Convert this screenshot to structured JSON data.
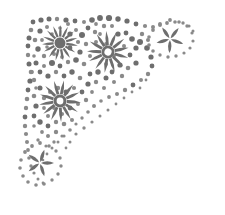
{
  "artwork": {
    "title": "Floral Corner Ornament",
    "kind": "decorative-corner-flourish",
    "orientation": "top-left-corner",
    "canvas": {
      "width": 225,
      "height": 215
    },
    "background_color": "#ffffff",
    "ink_color": "#6e6e6e",
    "ink_color_light": "#8a8a8a",
    "ink_color_dark": "#5f5f5f",
    "center_hole_color": "#ffffff",
    "style_notes": "halftone-stippled grayscale clipart, scanned line-art look",
    "element_counts": {
      "flowers": 3,
      "asterisk_sprigs": 2,
      "scatter_dots": 188
    }
  },
  "flowers": [
    {
      "name": "flower-top-left",
      "cx": 60,
      "cy": 43,
      "outer_radius": 18,
      "inner_radius": 6.5,
      "petals": 15,
      "rotation": 8,
      "has_open_center": false,
      "core_radius": 5.5,
      "color": "#6e6e6e"
    },
    {
      "name": "flower-top-right",
      "cx": 108,
      "cy": 52,
      "outer_radius": 21,
      "inner_radius": 7,
      "petals": 13,
      "rotation": 16,
      "has_open_center": true,
      "core_radius": 6.5,
      "hole_radius": 3.6,
      "color": "#6e6e6e"
    },
    {
      "name": "flower-lower-left",
      "cx": 60,
      "cy": 101,
      "outer_radius": 21,
      "inner_radius": 7,
      "petals": 13,
      "rotation": 4,
      "has_open_center": true,
      "core_radius": 6.5,
      "hole_radius": 3.4,
      "color": "#6e6e6e"
    }
  ],
  "sprigs": [
    {
      "name": "sprig-top-right",
      "cx": 170,
      "cy": 39,
      "arms": 5,
      "arm_length": 14,
      "arm_width": 3.4,
      "rotation": 20,
      "color": "#6e6e6e"
    },
    {
      "name": "sprig-bottom-left",
      "cx": 40,
      "cy": 163,
      "arms": 5,
      "arm_length": 14,
      "arm_width": 3.4,
      "rotation": 72,
      "color": "#6e6e6e"
    }
  ],
  "dot_paths": [
    {
      "name": "outline-arc-top",
      "description": "dotted arc sweeping along the upper edge from the left margin to the top-right sprig",
      "dots": [
        [
          33,
          22,
          2.4
        ],
        [
          41,
          20,
          2.6
        ],
        [
          49,
          19,
          2.5
        ],
        [
          57,
          19,
          2.2
        ],
        [
          66,
          20,
          2.6
        ],
        [
          75,
          21,
          2.4
        ],
        [
          84,
          22,
          2.0
        ],
        [
          92,
          20,
          2.8
        ],
        [
          100,
          18,
          2.9
        ],
        [
          109,
          18,
          3.1
        ],
        [
          118,
          19,
          2.7
        ],
        [
          127,
          21,
          2.6
        ],
        [
          136,
          24,
          2.4
        ],
        [
          145,
          26,
          2.1
        ],
        [
          153,
          27,
          2.0
        ],
        [
          160,
          25,
          1.9
        ],
        [
          167,
          23,
          1.9
        ],
        [
          175,
          22,
          1.8
        ],
        [
          183,
          23,
          1.7
        ],
        [
          189,
          26,
          1.6
        ],
        [
          193,
          31,
          1.5
        ]
      ]
    },
    {
      "name": "outline-arc-left",
      "description": "dotted arc running down the left edge toward the bottom sprig",
      "dots": [
        [
          31,
          30,
          2.3
        ],
        [
          29,
          38,
          2.5
        ],
        [
          28,
          46,
          2.4
        ],
        [
          28,
          55,
          2.2
        ],
        [
          29,
          64,
          2.5
        ],
        [
          31,
          72,
          2.3
        ],
        [
          30,
          81,
          2.6
        ],
        [
          28,
          90,
          2.4
        ],
        [
          27,
          99,
          2.3
        ],
        [
          26,
          108,
          2.2
        ],
        [
          25,
          117,
          2.4
        ],
        [
          25,
          126,
          2.2
        ],
        [
          26,
          134,
          2.1
        ],
        [
          27,
          142,
          2.0
        ],
        [
          28,
          150,
          1.9
        ],
        [
          29,
          158,
          1.8
        ],
        [
          31,
          166,
          1.7
        ],
        [
          34,
          173,
          1.6
        ],
        [
          38,
          179,
          1.5
        ],
        [
          43,
          183,
          1.4
        ]
      ]
    },
    {
      "name": "inner-diagonal-fade",
      "description": "dots thinning along the inner diagonal from top-right to bottom-left",
      "dots": [
        [
          140,
          42,
          3.0
        ],
        [
          147,
          48,
          2.8
        ],
        [
          151,
          57,
          2.6
        ],
        [
          152,
          66,
          2.4
        ],
        [
          148,
          74,
          2.2
        ],
        [
          141,
          80,
          2.0
        ],
        [
          133,
          85,
          2.4
        ],
        [
          125,
          90,
          2.2
        ],
        [
          117,
          94,
          2.0
        ],
        [
          109,
          97,
          1.9
        ],
        [
          101,
          101,
          1.8
        ],
        [
          94,
          106,
          2.0
        ],
        [
          88,
          112,
          1.8
        ],
        [
          82,
          118,
          1.7
        ],
        [
          76,
          124,
          1.6
        ],
        [
          70,
          130,
          1.8
        ],
        [
          64,
          136,
          1.6
        ],
        [
          58,
          142,
          1.5
        ],
        [
          52,
          148,
          1.5
        ],
        [
          47,
          154,
          1.4
        ],
        [
          43,
          160,
          1.3
        ]
      ]
    },
    {
      "name": "sprig-top-right-ring",
      "description": "ring of dots encircling the top-right sprig",
      "dots": [
        [
          170,
          20,
          1.9
        ],
        [
          179,
          22,
          1.8
        ],
        [
          187,
          26,
          1.7
        ],
        [
          192,
          33,
          1.6
        ],
        [
          193,
          41,
          1.6
        ],
        [
          190,
          48,
          1.6
        ],
        [
          184,
          53,
          1.6
        ],
        [
          176,
          56,
          1.7
        ],
        [
          168,
          57,
          1.7
        ],
        [
          160,
          55,
          1.7
        ],
        [
          153,
          51,
          1.8
        ],
        [
          149,
          45,
          1.8
        ],
        [
          149,
          37,
          1.8
        ],
        [
          153,
          30,
          1.9
        ],
        [
          160,
          24,
          1.9
        ]
      ]
    },
    {
      "name": "sprig-bottom-left-ring",
      "description": "ring of dots encircling the bottom-left sprig",
      "dots": [
        [
          40,
          143,
          1.9
        ],
        [
          49,
          146,
          1.8
        ],
        [
          56,
          151,
          1.7
        ],
        [
          60,
          158,
          1.7
        ],
        [
          61,
          166,
          1.7
        ],
        [
          58,
          174,
          1.7
        ],
        [
          52,
          180,
          1.7
        ],
        [
          44,
          184,
          1.8
        ],
        [
          36,
          185,
          1.8
        ],
        [
          28,
          182,
          1.8
        ],
        [
          23,
          176,
          1.8
        ],
        [
          20,
          168,
          1.8
        ],
        [
          21,
          160,
          1.8
        ],
        [
          25,
          152,
          1.9
        ],
        [
          32,
          146,
          1.9
        ]
      ]
    },
    {
      "name": "scatter-field",
      "description": "dense stipple fill of varied dots filling the corner triangle between the flowers",
      "dots": [
        [
          40,
          31,
          2.6
        ],
        [
          47,
          27,
          2.0
        ],
        [
          35,
          40,
          2.3
        ],
        [
          38,
          49,
          2.7
        ],
        [
          44,
          56,
          2.2
        ],
        [
          36,
          63,
          2.5
        ],
        [
          44,
          66,
          2.0
        ],
        [
          52,
          63,
          3.0
        ],
        [
          60,
          66,
          2.4
        ],
        [
          68,
          62,
          2.2
        ],
        [
          76,
          60,
          2.8
        ],
        [
          84,
          64,
          2.3
        ],
        [
          80,
          52,
          2.6
        ],
        [
          86,
          44,
          2.2
        ],
        [
          82,
          35,
          3.0
        ],
        [
          88,
          28,
          2.4
        ],
        [
          95,
          32,
          2.2
        ],
        [
          76,
          30,
          2.0
        ],
        [
          70,
          34,
          2.6
        ],
        [
          78,
          42,
          2.1
        ],
        [
          70,
          48,
          2.4
        ],
        [
          62,
          57,
          1.9
        ],
        [
          54,
          54,
          2.0
        ],
        [
          47,
          47,
          1.8
        ],
        [
          96,
          42,
          2.0
        ],
        [
          100,
          34,
          1.9
        ],
        [
          118,
          34,
          2.6
        ],
        [
          126,
          33,
          2.4
        ],
        [
          132,
          39,
          2.8
        ],
        [
          136,
          48,
          2.6
        ],
        [
          130,
          55,
          2.4
        ],
        [
          136,
          63,
          2.6
        ],
        [
          128,
          68,
          2.3
        ],
        [
          120,
          65,
          2.6
        ],
        [
          112,
          72,
          2.4
        ],
        [
          122,
          76,
          2.2
        ],
        [
          114,
          82,
          2.0
        ],
        [
          106,
          78,
          2.5
        ],
        [
          98,
          72,
          2.7
        ],
        [
          90,
          74,
          2.4
        ],
        [
          96,
          82,
          2.2
        ],
        [
          104,
          88,
          2.0
        ],
        [
          88,
          84,
          2.6
        ],
        [
          80,
          78,
          2.3
        ],
        [
          72,
          72,
          2.7
        ],
        [
          64,
          76,
          2.4
        ],
        [
          56,
          72,
          2.2
        ],
        [
          48,
          76,
          2.6
        ],
        [
          40,
          72,
          2.4
        ],
        [
          34,
          80,
          2.2
        ],
        [
          40,
          88,
          2.5
        ],
        [
          34,
          96,
          2.3
        ],
        [
          36,
          106,
          2.6
        ],
        [
          34,
          116,
          2.4
        ],
        [
          40,
          122,
          2.7
        ],
        [
          48,
          126,
          2.4
        ],
        [
          56,
          122,
          2.2
        ],
        [
          48,
          116,
          2.0
        ],
        [
          44,
          108,
          1.9
        ],
        [
          82,
          92,
          2.4
        ],
        [
          74,
          88,
          2.1
        ],
        [
          66,
          92,
          2.5
        ],
        [
          58,
          88,
          2.2
        ],
        [
          50,
          92,
          2.0
        ],
        [
          44,
          98,
          2.2
        ],
        [
          86,
          100,
          2.2
        ],
        [
          78,
          104,
          2.0
        ],
        [
          70,
          108,
          2.4
        ],
        [
          62,
          114,
          2.1
        ],
        [
          54,
          108,
          1.9
        ],
        [
          64,
          124,
          2.3
        ],
        [
          72,
          120,
          2.0
        ],
        [
          56,
          132,
          2.2
        ],
        [
          48,
          136,
          2.0
        ],
        [
          42,
          132,
          1.9
        ],
        [
          64,
          104,
          1.8
        ],
        [
          92,
          92,
          1.9
        ],
        [
          106,
          64,
          2.0
        ],
        [
          114,
          56,
          1.9
        ],
        [
          106,
          44,
          1.9
        ],
        [
          124,
          46,
          2.0
        ],
        [
          142,
          34,
          2.2
        ],
        [
          148,
          40,
          2.0
        ],
        [
          90,
          56,
          2.0
        ],
        [
          36,
          88,
          1.8
        ],
        [
          32,
          72,
          1.9
        ],
        [
          34,
          56,
          1.8
        ],
        [
          42,
          40,
          1.9
        ],
        [
          52,
          34,
          1.8
        ],
        [
          68,
          24,
          2.0
        ],
        [
          60,
          28,
          1.8
        ],
        [
          104,
          26,
          2.2
        ],
        [
          112,
          26,
          2.0
        ],
        [
          96,
          24,
          1.9
        ],
        [
          34,
          126,
          1.8
        ],
        [
          38,
          140,
          1.7
        ],
        [
          46,
          146,
          1.6
        ],
        [
          54,
          142,
          1.7
        ],
        [
          62,
          136,
          1.6
        ],
        [
          70,
          142,
          1.5
        ],
        [
          66,
          148,
          1.4
        ],
        [
          76,
          134,
          1.6
        ],
        [
          84,
          128,
          1.7
        ],
        [
          92,
          122,
          1.6
        ],
        [
          100,
          116,
          1.5
        ],
        [
          108,
          110,
          1.5
        ],
        [
          116,
          104,
          1.4
        ],
        [
          124,
          98,
          1.4
        ],
        [
          132,
          92,
          1.4
        ],
        [
          140,
          88,
          1.4
        ],
        [
          146,
          80,
          1.4
        ]
      ]
    }
  ]
}
